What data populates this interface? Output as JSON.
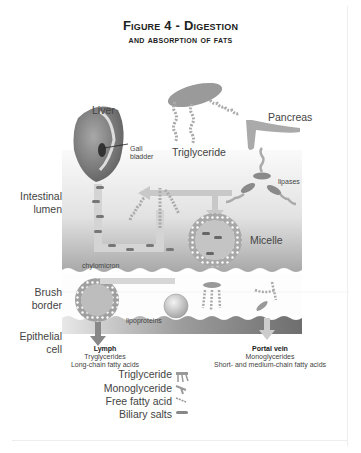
{
  "title": {
    "line1": "Figure 4 - Digestion",
    "line2": "and absorption of fats"
  },
  "labels": {
    "liver": "Liver",
    "gall_bladder_1": "Gall",
    "gall_bladder_2": "bladder",
    "triglyceride": "Triglyceride",
    "pancreas": "Pancreas",
    "lipases": "lipases",
    "intestinal_lumen_1": "Intestinal",
    "intestinal_lumen_2": "lumen",
    "micelle": "Micelle",
    "chylomicron": "chylomicron",
    "brush_border_1": "Brush",
    "brush_border_2": "border",
    "lipoproteins": "lipoproteins",
    "epithelial_cell_1": "Epithelial",
    "epithelial_cell_2": "cell"
  },
  "lymph": {
    "title": "Lymph",
    "line1": "Tryglycerides",
    "line2": "Long-chain fatty acids"
  },
  "portal_vein": {
    "title": "Portal vein",
    "line1": "Monoglycerides",
    "line2": "Short- and medium-chain fatty acids"
  },
  "legend": [
    {
      "label": "Triglyceride",
      "icon": "triglyceride-icon"
    },
    {
      "label": "Monoglyceride",
      "icon": "monoglyceride-icon"
    },
    {
      "label": "Free fatty acid",
      "icon": "free-fatty-acid-icon"
    },
    {
      "label": "Biliary salts",
      "icon": "biliary-salts-icon"
    }
  ],
  "colors": {
    "lumen_gradient_top": "#f4f4f4",
    "lumen_gradient_bottom": "#b8b8b8",
    "membrane": "#9a9a9a",
    "organ": "#8c8c8c",
    "arrow": "#c8c8c8"
  }
}
